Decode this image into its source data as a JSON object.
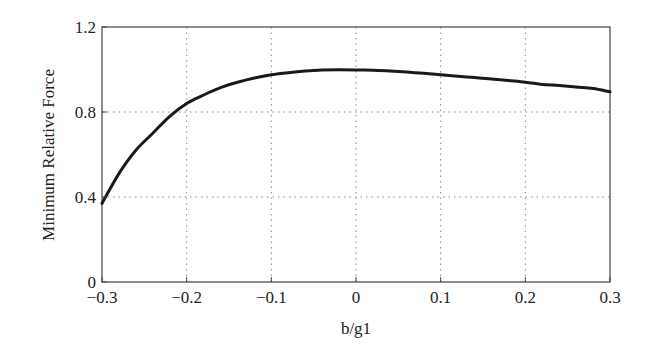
{
  "chart_data": {
    "type": "line",
    "title": "",
    "xlabel": "b/g1",
    "ylabel": "Minimum Relative Force",
    "xlim": [
      -0.3,
      0.3
    ],
    "ylim": [
      0,
      1.2
    ],
    "xticks": [
      -0.3,
      -0.2,
      -0.1,
      0,
      0.1,
      0.2,
      0.3
    ],
    "xtick_labels": [
      "−0.3",
      "−0.2",
      "−0.1",
      "0",
      "0.1",
      "0.2",
      "0.3"
    ],
    "yticks": [
      0,
      0.4,
      0.8,
      1.2
    ],
    "ytick_labels": [
      "0",
      "0.4",
      "0.8",
      "1.2"
    ],
    "grid": true,
    "grid_style": "dotted",
    "legend": null,
    "series": [
      {
        "name": "Minimum Relative Force",
        "color": "#1a1a1a",
        "x": [
          -0.3,
          -0.28,
          -0.26,
          -0.24,
          -0.22,
          -0.2,
          -0.18,
          -0.16,
          -0.14,
          -0.12,
          -0.1,
          -0.08,
          -0.06,
          -0.04,
          -0.02,
          0,
          0.02,
          0.04,
          0.06,
          0.08,
          0.1,
          0.12,
          0.14,
          0.16,
          0.18,
          0.2,
          0.22,
          0.24,
          0.26,
          0.28,
          0.3
        ],
        "y": [
          0.37,
          0.51,
          0.62,
          0.7,
          0.78,
          0.84,
          0.88,
          0.915,
          0.94,
          0.96,
          0.975,
          0.985,
          0.993,
          0.998,
          0.999,
          0.998,
          0.996,
          0.993,
          0.988,
          0.982,
          0.975,
          0.968,
          0.962,
          0.955,
          0.948,
          0.94,
          0.93,
          0.925,
          0.918,
          0.91,
          0.895
        ]
      }
    ]
  }
}
